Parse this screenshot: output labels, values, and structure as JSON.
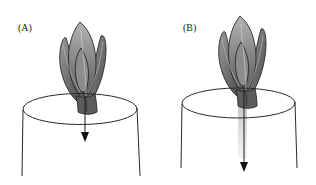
{
  "figure": {
    "panels": [
      {
        "label": "(A)",
        "description": "Shoot apex on stem; short arrow showing downward transport from apex into stem",
        "arrow_length": "short"
      },
      {
        "label": "(B)",
        "description": "Shoot apex on stem; long arrow with shaded band showing extended downward transport through stem",
        "arrow_length": "long"
      }
    ],
    "colors": {
      "leaf_light": "#a8a8a8",
      "leaf_dark": "#5a5a5a",
      "outline": "#2a2a2a",
      "shading_band": "#c8c8c8",
      "background": "#ffffff"
    }
  }
}
